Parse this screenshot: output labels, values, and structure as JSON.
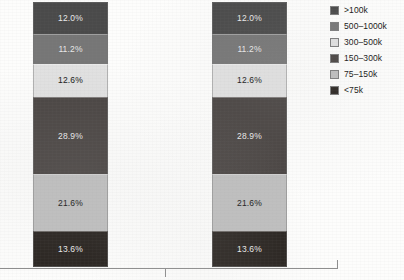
{
  "chart_data": {
    "type": "bar",
    "title": "",
    "subtitle": "",
    "xlabel": "",
    "ylabel": "",
    "stacked": true,
    "normalized_percent": true,
    "ylim": [
      0,
      100
    ],
    "grid": false,
    "legend_position": "right",
    "categories": [
      "",
      ""
    ],
    "series": [
      {
        "name": ">100k",
        "color": "#4a4a4a",
        "values": [
          12.0,
          12.0
        ],
        "labels": [
          "12.0%",
          "12.0%"
        ]
      },
      {
        "name": "500–1000k",
        "color": "#767676",
        "values": [
          11.2,
          11.2
        ],
        "labels": [
          "11.2%",
          "11.2%"
        ]
      },
      {
        "name": "300–500k",
        "color": "#e1e1e1",
        "values": [
          12.6,
          12.6
        ],
        "labels": [
          "12.6%",
          "12.6%"
        ]
      },
      {
        "name": "150–300k",
        "color": "#4a4543",
        "values": [
          28.9,
          28.9
        ],
        "labels": [
          "28.9%",
          "28.9%"
        ]
      },
      {
        "name": "75–150k",
        "color": "#bfbfbf",
        "values": [
          21.6,
          21.6
        ],
        "labels": [
          "21.6%",
          "21.6%"
        ]
      },
      {
        "name": "<75k",
        "color": "#2b2622",
        "values": [
          13.6,
          13.6
        ],
        "labels": [
          "13.6%",
          "13.6%"
        ]
      }
    ]
  },
  "bars": [
    {
      "name": "bar-1",
      "segments": [
        {
          "label": "12.0%",
          "legend": ">100k",
          "value": 12.0,
          "color": "#4a4a4a",
          "text": "light"
        },
        {
          "label": "11.2%",
          "legend": "500–1000k",
          "value": 11.2,
          "color": "#767676",
          "text": "light"
        },
        {
          "label": "12.6%",
          "legend": "300–500k",
          "value": 12.6,
          "color": "#e1e1e1",
          "text": "dark"
        },
        {
          "label": "28.9%",
          "legend": "150–300k",
          "value": 28.9,
          "color": "#4a4543",
          "text": "light"
        },
        {
          "label": "21.6%",
          "legend": "75–150k",
          "value": 21.6,
          "color": "#bfbfbf",
          "text": "dark"
        },
        {
          "label": "13.6%",
          "legend": "<75k",
          "value": 13.6,
          "color": "#2b2622",
          "text": "light"
        }
      ]
    },
    {
      "name": "bar-2",
      "segments": [
        {
          "label": "12.0%",
          "legend": ">100k",
          "value": 12.0,
          "color": "#4a4a4a",
          "text": "light"
        },
        {
          "label": "11.2%",
          "legend": "500–1000k",
          "value": 11.2,
          "color": "#767676",
          "text": "light"
        },
        {
          "label": "12.6%",
          "legend": "300–500k",
          "value": 12.6,
          "color": "#e1e1e1",
          "text": "dark"
        },
        {
          "label": "28.9%",
          "legend": "150–300k",
          "value": 28.9,
          "color": "#4a4543",
          "text": "light"
        },
        {
          "label": "21.6%",
          "legend": "75–150k",
          "value": 21.6,
          "color": "#bfbfbf",
          "text": "dark"
        },
        {
          "label": "13.6%",
          "legend": "<75k",
          "value": 13.6,
          "color": "#2b2622",
          "text": "light"
        }
      ]
    }
  ],
  "legend": {
    "items": [
      {
        "label": ">100k",
        "color": "#4a4a4a"
      },
      {
        "label": "500–1000k",
        "color": "#767676"
      },
      {
        "label": "300–500k",
        "color": "#e1e1e1"
      },
      {
        "label": "150–300k",
        "color": "#4a4543"
      },
      {
        "label": "75–150k",
        "color": "#bfbfbf"
      },
      {
        "label": "<75k",
        "color": "#2b2622"
      }
    ]
  },
  "axis": {
    "line_color": "#8e8e8e",
    "ticks": [
      "",
      ""
    ]
  }
}
